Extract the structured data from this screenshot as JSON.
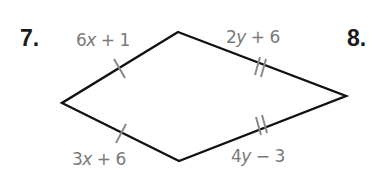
{
  "problems": [
    {
      "number": "7.",
      "figure": "kite",
      "sides": {
        "top_left": {
          "expression": "6x + 1",
          "coef": "6",
          "var": "x",
          "op": " + ",
          "const": "1",
          "tick_marks": 1
        },
        "top_right": {
          "expression": "2y + 6",
          "coef": "2",
          "var": "y",
          "op": " + ",
          "const": "6",
          "tick_marks": 2
        },
        "bottom_left": {
          "expression": "3x + 6",
          "coef": "3",
          "var": "x",
          "op": " + ",
          "const": "6",
          "tick_marks": 1
        },
        "bottom_right": {
          "expression": "4y − 3",
          "coef": "4",
          "var": "y",
          "op": " − ",
          "const": "3",
          "tick_marks": 2
        }
      },
      "vertices": {
        "top": [
          178,
          32
        ],
        "right": [
          346,
          96
        ],
        "bottom": [
          179,
          161
        ],
        "left": [
          62,
          103
        ]
      }
    },
    {
      "number": "8."
    }
  ],
  "colors": {
    "outline": "#111111",
    "tick": "#8a8a8a",
    "label": "#7a7a7a",
    "number": "#1a1a1a"
  }
}
